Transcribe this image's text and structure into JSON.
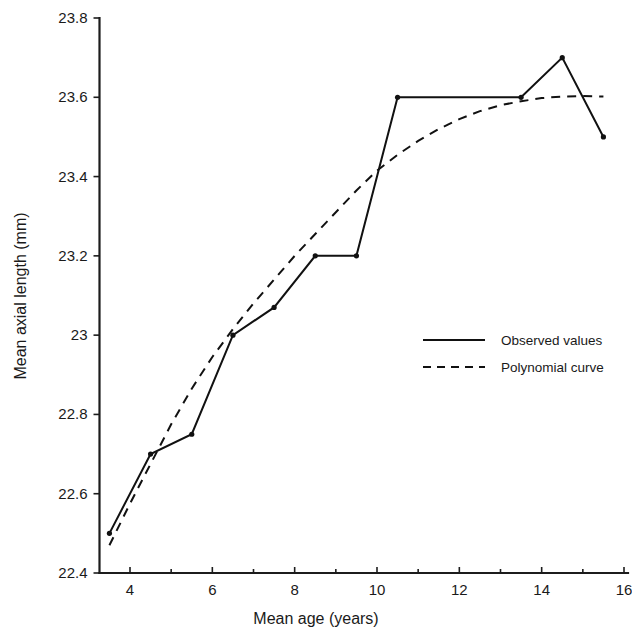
{
  "chart_data": {
    "type": "line",
    "title": "",
    "xlabel": "Mean age (years)",
    "ylabel": "Mean axial length (mm)",
    "xlim": [
      3.0,
      16.0
    ],
    "ylim": [
      22.4,
      23.8
    ],
    "xticks": [
      4,
      6,
      8,
      10,
      12,
      14,
      16
    ],
    "xtick_labels": [
      "4",
      "6",
      "8",
      "10",
      "12",
      "14",
      "16"
    ],
    "xminorticks": [
      5,
      7,
      9,
      11,
      13,
      15
    ],
    "yticks": [
      22.4,
      22.6,
      22.8,
      23.0,
      23.2,
      23.4,
      23.6,
      23.8
    ],
    "ytick_labels": [
      "22.4",
      "22.6",
      "22.8",
      "23",
      "23.2",
      "23.4",
      "23.6",
      "23.8"
    ],
    "grid": false,
    "legend_position": "center-right",
    "series": [
      {
        "name": "Observed values",
        "style": "solid",
        "markers": true,
        "x": [
          3.5,
          4.5,
          5.5,
          6.5,
          7.5,
          8.5,
          9.5,
          10.5,
          13.5,
          14.5,
          15.5
        ],
        "values": [
          22.5,
          22.7,
          22.75,
          23.0,
          23.07,
          23.2,
          23.2,
          23.6,
          23.6,
          23.7,
          23.5
        ]
      },
      {
        "name": "Polynomial curve",
        "style": "dashed",
        "markers": false,
        "x": [
          3.5,
          4.0,
          4.5,
          5.0,
          5.5,
          6.0,
          6.5,
          7.0,
          7.5,
          8.0,
          8.5,
          9.0,
          9.5,
          10.0,
          10.5,
          11.0,
          11.5,
          12.0,
          12.5,
          13.0,
          13.5,
          14.0,
          14.5,
          15.0,
          15.5
        ],
        "values": [
          22.47,
          22.575,
          22.675,
          22.775,
          22.865,
          22.945,
          23.015,
          23.08,
          23.14,
          23.2,
          23.255,
          23.31,
          23.365,
          23.415,
          23.455,
          23.49,
          23.52,
          23.545,
          23.565,
          23.58,
          23.59,
          23.598,
          23.602,
          23.603,
          23.602
        ]
      }
    ]
  },
  "legend": {
    "entries": [
      {
        "label": "Observed values",
        "style": "solid"
      },
      {
        "label": "Polynomial curve",
        "style": "dashed"
      }
    ]
  },
  "colors": {
    "ink": "#111111",
    "background": "#ffffff"
  }
}
